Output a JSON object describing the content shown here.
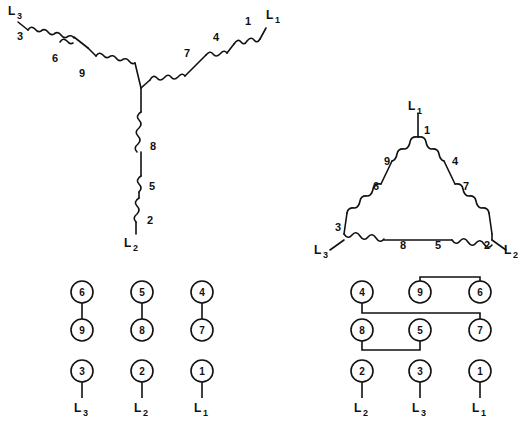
{
  "figure": {
    "background_color": "#ffffff",
    "line_color": "#111111"
  },
  "wye_schematic": {
    "name": "wye-star-winding-schematic",
    "arms": [
      {
        "name": "arm-l3",
        "line_label": "L",
        "line_sub": "3",
        "coil_labels": [
          "3",
          "6",
          "9"
        ]
      },
      {
        "name": "arm-l1",
        "line_label": "L",
        "line_sub": "1",
        "coil_labels": [
          "1",
          "4",
          "7"
        ]
      },
      {
        "name": "arm-l2",
        "line_label": "L",
        "line_sub": "2",
        "coil_labels": [
          "8",
          "5",
          "2"
        ]
      }
    ]
  },
  "delta_schematic": {
    "name": "delta-winding-schematic",
    "apex_label": {
      "line_label": "L",
      "line_sub": "1"
    },
    "left_label": {
      "line_label": "L",
      "line_sub": "3"
    },
    "right_label": {
      "line_label": "L",
      "line_sub": "2"
    },
    "coil_labels": {
      "apex": "1",
      "left_upper": "9",
      "left_lower": "6",
      "right_upper": "4",
      "right_lower": "7",
      "bottom_left_corner": "3",
      "bottom_left": "8",
      "bottom_right": "5",
      "bottom_right_corner": "2"
    }
  },
  "wye_terminal_board": {
    "name": "wye-terminal-board",
    "rows": [
      {
        "terminals": [
          "6",
          "5",
          "4"
        ]
      },
      {
        "terminals": [
          "9",
          "8",
          "7"
        ]
      },
      {
        "terminals": [
          "3",
          "2",
          "1"
        ]
      }
    ],
    "jumpers": [
      "6-9",
      "5-8",
      "4-7"
    ],
    "line_labels": [
      {
        "line_label": "L",
        "line_sub": "3"
      },
      {
        "line_label": "L",
        "line_sub": "2"
      },
      {
        "line_label": "L",
        "line_sub": "1"
      }
    ]
  },
  "delta_terminal_board": {
    "name": "delta-terminal-board",
    "rows": [
      {
        "terminals": [
          "4",
          "9",
          "6"
        ]
      },
      {
        "terminals": [
          "8",
          "5",
          "7"
        ]
      },
      {
        "terminals": [
          "2",
          "3",
          "1"
        ]
      }
    ],
    "jumpers": [
      "9-6",
      "4-7",
      "8-5"
    ],
    "line_labels": [
      {
        "line_label": "L",
        "line_sub": "2"
      },
      {
        "line_label": "L",
        "line_sub": "3"
      },
      {
        "line_label": "L",
        "line_sub": "1"
      }
    ]
  }
}
